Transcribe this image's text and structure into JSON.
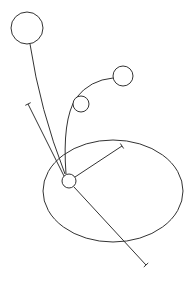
{
  "canvas": {
    "width": 195,
    "height": 285,
    "background": "#ffffff",
    "stroke": "#333333"
  },
  "ellipse": {
    "cx": 113,
    "cy": 191,
    "rx": 70,
    "ry": 51
  },
  "hub": {
    "cx": 69,
    "cy": 181,
    "r": 7
  },
  "nodes": [
    {
      "name": "top-left-node",
      "cx": 27,
      "cy": 28,
      "r": 16
    },
    {
      "name": "right-node",
      "cx": 123,
      "cy": 76,
      "r": 10
    },
    {
      "name": "small-node",
      "cx": 81,
      "cy": 104,
      "r": 8
    }
  ],
  "segments": [
    {
      "name": "whisker-upper-left",
      "x1": 64,
      "y1": 176,
      "x2": 28,
      "y2": 104
    },
    {
      "name": "whisker-upper-right",
      "x1": 75,
      "y1": 177,
      "x2": 122,
      "y2": 146
    },
    {
      "name": "whisker-lower-right",
      "x1": 74,
      "y1": 187,
      "x2": 146,
      "y2": 265
    }
  ],
  "tethers": [
    {
      "name": "tether-top-node",
      "d": "M 30 44 Q 40 110 65 174"
    },
    {
      "name": "tether-right-node",
      "d": "M 113 78 Q 90 80 76 98 Q 62 120 66 174"
    }
  ]
}
